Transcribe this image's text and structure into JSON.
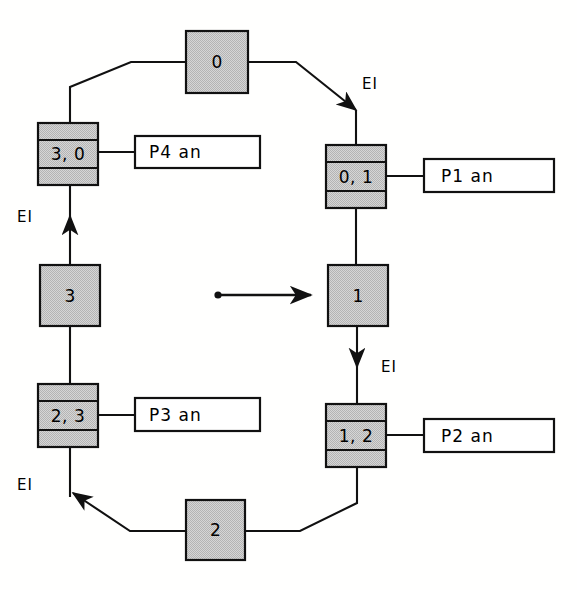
{
  "diagram": {
    "colors": {
      "fill_gray": "#c9c9c9",
      "stroke": "#1a1a1a",
      "label_fill": "#ffffff",
      "background": "#ffffff"
    },
    "places": [
      {
        "id": "p0",
        "label": "0",
        "x": 186,
        "y": 31,
        "w": 62,
        "h": 62
      },
      {
        "id": "p1",
        "label": "1",
        "x": 328,
        "y": 265,
        "w": 60,
        "h": 61
      },
      {
        "id": "p2",
        "label": "2",
        "x": 186,
        "y": 500,
        "w": 59,
        "h": 60
      },
      {
        "id": "p3",
        "label": "3",
        "x": 40,
        "y": 265,
        "w": 60,
        "h": 61
      }
    ],
    "transitions": [
      {
        "id": "t30",
        "label": "3, 0",
        "x": 38,
        "y": 123,
        "w": 60,
        "h": 62,
        "band": 17
      },
      {
        "id": "t01",
        "label": "0, 1",
        "x": 326,
        "y": 145,
        "w": 60,
        "h": 63,
        "band": 17
      },
      {
        "id": "t12",
        "label": "1, 2",
        "x": 326,
        "y": 404,
        "w": 60,
        "h": 63,
        "band": 17
      },
      {
        "id": "t23",
        "label": "2, 3",
        "x": 38,
        "y": 384,
        "w": 60,
        "h": 63,
        "band": 17
      }
    ],
    "annotations": [
      {
        "id": "a4",
        "label": "P4 an",
        "x": 135,
        "y": 136,
        "w": 125,
        "h": 32,
        "from": "t30"
      },
      {
        "id": "a1",
        "label": "P1 an",
        "x": 424,
        "y": 159,
        "w": 130,
        "h": 33,
        "from": "t01"
      },
      {
        "id": "a2",
        "label": "P2 an",
        "x": 424,
        "y": 419,
        "w": 130,
        "h": 33,
        "from": "t12"
      },
      {
        "id": "a3",
        "label": "P3 an",
        "x": 135,
        "y": 398,
        "w": 125,
        "h": 33,
        "from": "t23"
      }
    ],
    "arrow_labels": [
      {
        "id": "ei-top-right",
        "label": "EI",
        "x": 362,
        "y": 75
      },
      {
        "id": "ei-mid-right",
        "label": "EI",
        "x": 381,
        "y": 358
      },
      {
        "id": "ei-bottom-left",
        "label": "EI",
        "x": 17,
        "y": 476
      },
      {
        "id": "ei-mid-left",
        "label": "EI",
        "x": 17,
        "y": 208
      }
    ],
    "token_arrow": {
      "id": "token-indicator",
      "dot_x": 218,
      "dot_y": 295,
      "tip_x": 320,
      "tip_y": 295
    },
    "edges": [
      {
        "id": "e-p0-t30",
        "desc": "place 0 to transition 3,0"
      },
      {
        "id": "e-p0-t01",
        "desc": "place 0 to transition 0,1",
        "arrow": true
      },
      {
        "id": "e-t01-p1",
        "desc": "transition 0,1 to place 1"
      },
      {
        "id": "e-p1-t12",
        "desc": "place 1 to transition 1,2",
        "arrow": true
      },
      {
        "id": "e-t12-p2",
        "desc": "transition 1,2 to place 2"
      },
      {
        "id": "e-p2-t23",
        "desc": "place 2 to transition 2,3",
        "arrow": true
      },
      {
        "id": "e-t23-p3",
        "desc": "transition 2,3 to place 3"
      },
      {
        "id": "e-p3-t30",
        "desc": "place 3 to transition 3,0",
        "arrow": true
      }
    ]
  }
}
